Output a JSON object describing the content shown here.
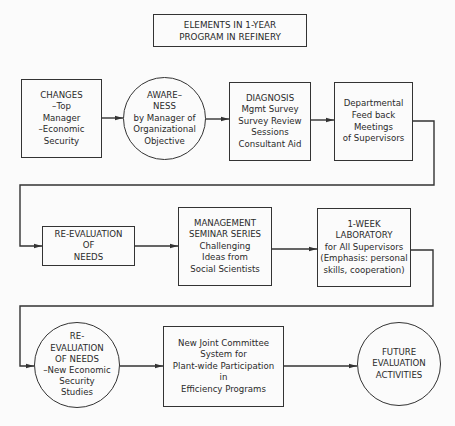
{
  "title": {
    "lines": [
      "ELEMENTS IN 1-YEAR",
      "PROGRAM IN REFINERY"
    ]
  },
  "rows": [
    {
      "nodes": [
        {
          "id": "changes",
          "shape": "rectangle",
          "lines": [
            "CHANGES",
            "–Top",
            "Manager",
            "–Economic",
            "Security"
          ]
        },
        {
          "id": "awareness",
          "shape": "circle",
          "lines": [
            "AWARE–",
            "NESS",
            "by Manager of",
            "Organizational",
            "Objective"
          ]
        },
        {
          "id": "diagnosis",
          "shape": "rectangle",
          "lines": [
            "DIAGNOSIS",
            "Mgmt Survey",
            "Survey Review",
            "Sessions",
            "Consultant Aid"
          ]
        },
        {
          "id": "departmental-feedback",
          "shape": "rectangle",
          "lines": [
            "Departmental",
            "Feed back",
            "Meetings",
            "of Supervisors"
          ]
        }
      ]
    },
    {
      "nodes": [
        {
          "id": "re-evaluation-needs",
          "shape": "rectangle",
          "lines": [
            "RE-EVALUATION",
            "OF",
            "NEEDS"
          ]
        },
        {
          "id": "management-seminar",
          "shape": "rectangle",
          "lines": [
            "MANAGEMENT",
            "SEMINAR SERIES",
            "Challenging",
            "Ideas from",
            "Social Scientists"
          ]
        },
        {
          "id": "one-week-laboratory",
          "shape": "rectangle",
          "lines": [
            "1-WEEK",
            "LABORATORY",
            "for All Supervisors",
            "(Emphasis: personal",
            "skills, cooperation)"
          ]
        }
      ]
    },
    {
      "nodes": [
        {
          "id": "re-evaluation-security",
          "shape": "circle",
          "lines": [
            "RE-",
            "EVALUATION",
            "OF NEEDS",
            "–New Economic",
            "Security",
            "Studies"
          ]
        },
        {
          "id": "joint-committee",
          "shape": "rectangle",
          "lines": [
            "New Joint Committee",
            "System for",
            "Plant-wide Participation",
            "in",
            "Efficiency Programs"
          ]
        },
        {
          "id": "future-evaluation",
          "shape": "circle",
          "lines": [
            "FUTURE",
            "EVALUATION",
            "ACTIVITIES"
          ]
        }
      ]
    }
  ],
  "edges": [
    [
      "changes",
      "awareness"
    ],
    [
      "awareness",
      "diagnosis"
    ],
    [
      "diagnosis",
      "departmental-feedback"
    ],
    [
      "departmental-feedback",
      "re-evaluation-needs"
    ],
    [
      "re-evaluation-needs",
      "management-seminar"
    ],
    [
      "management-seminar",
      "one-week-laboratory"
    ],
    [
      "one-week-laboratory",
      "re-evaluation-security"
    ],
    [
      "re-evaluation-security",
      "joint-committee"
    ],
    [
      "joint-committee",
      "future-evaluation"
    ]
  ],
  "colors": {
    "line": "#333333",
    "background": "#fbfbfb",
    "text": "#2a2a2a"
  }
}
